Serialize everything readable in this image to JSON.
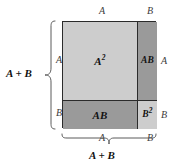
{
  "figure": {
    "colors": {
      "square_light": "#cdcdcd",
      "square_dark": "#9a9a9a",
      "outline": "#2b2b2b",
      "brace": "#5a5a5a",
      "background": "#ffffff",
      "label_text": "#121212",
      "dim_text": "#3c3c3c"
    },
    "cells": [
      {
        "id": "a-squared",
        "label": "A",
        "exponent": "2",
        "fill": "light",
        "position": "top-left"
      },
      {
        "id": "ab-right",
        "label": "AB",
        "exponent": "",
        "fill": "dark",
        "position": "top-right"
      },
      {
        "id": "ab-bottom",
        "label": "AB",
        "exponent": "",
        "fill": "dark",
        "position": "bottom-left"
      },
      {
        "id": "b-squared",
        "label": "B",
        "exponent": "2",
        "fill": "light",
        "position": "bottom-right"
      }
    ],
    "dimensions": {
      "top_left": "A",
      "top_right": "B",
      "right_top": "A",
      "right_bottom": "B",
      "left_top": "A",
      "left_bottom": "B",
      "bottom_left": "A",
      "bottom_right": "B"
    },
    "sums": {
      "left": "A + B",
      "bottom": "A + B"
    }
  }
}
